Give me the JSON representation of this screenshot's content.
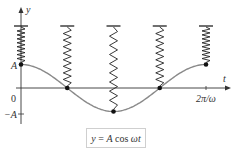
{
  "figure": {
    "axes": {
      "y_label": "y",
      "x_label": "t",
      "origin_label": "0",
      "y_pos_label": "A",
      "y_neg_label": "−A",
      "x_end_label": "2π/ω"
    },
    "curve": {
      "function": "y = A cos ωt",
      "period_fraction_shown": 1,
      "color": "#8a8a8a"
    },
    "snapshots": [
      {
        "phase": "0",
        "displacement": "A",
        "state": "compressed"
      },
      {
        "phase": "π/2",
        "displacement": "0",
        "state": "equilibrium"
      },
      {
        "phase": "π",
        "displacement": "−A",
        "state": "stretched"
      },
      {
        "phase": "3π/2",
        "displacement": "0",
        "state": "equilibrium"
      },
      {
        "phase": "2π",
        "displacement": "A",
        "state": "compressed"
      }
    ],
    "formula": {
      "lhs": "y",
      "eq": " = ",
      "amp": "A",
      "func": " cos ",
      "arg": "ωt"
    }
  }
}
